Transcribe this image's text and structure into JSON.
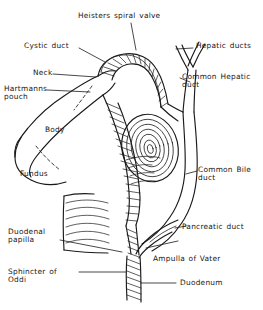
{
  "figure": {
    "background_color": "#ffffff",
    "ink_color": "#1a1a1a",
    "width": 263,
    "height": 310
  },
  "labels": {
    "heisters_spiral_valve": "Heisters spiral valve",
    "cystic_duct": "Cystic duct",
    "neck": "Neck",
    "hartmanns_pouch_l1": "Hartmanns",
    "hartmanns_pouch_l2": "pouch",
    "body": "Body",
    "fundus": "Fundus",
    "hepatic_ducts": "Hepatic ducts",
    "common_hepatic_duct_l1": "Common Hepatic",
    "common_hepatic_duct_l2": "duct",
    "common_bile_duct_l1": "Common Bile",
    "common_bile_duct_l2": "duct",
    "pancreatic_duct": "Pancreatic duct",
    "ampulla_of_vater": "Ampulla of Vater",
    "duodenum": "Duodenum",
    "duodenal_papilla_l1": "Duodenal",
    "duodenal_papilla_l2": "papilla",
    "sphincter_of_oddi_l1": "Sphincter of",
    "sphincter_of_oddi_l2": "Oddi"
  }
}
